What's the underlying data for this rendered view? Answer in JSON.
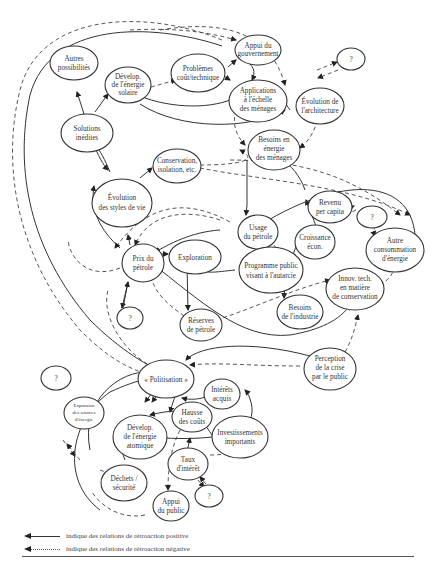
{
  "diagram": {
    "nodes": [
      {
        "id": "autres_possibilites",
        "lines": [
          "Autres",
          "possibilités"
        ]
      },
      {
        "id": "develop_solaire",
        "lines": [
          "Dévelop.",
          "de l'énergie",
          "solaire"
        ]
      },
      {
        "id": "problemes",
        "lines": [
          "Problèmes",
          "coût/technique"
        ]
      },
      {
        "id": "appui_gouvernement",
        "lines": [
          "Appui du",
          "gouvernement"
        ]
      },
      {
        "id": "q1",
        "lines": [
          "?"
        ]
      },
      {
        "id": "applications_menages",
        "lines": [
          "Applications",
          "à l'échelle",
          "des ménages"
        ]
      },
      {
        "id": "evolution_architecture",
        "lines": [
          "Évolution de",
          "l'architecture"
        ]
      },
      {
        "id": "solutions_inedites",
        "lines": [
          "Solutions",
          "inédites"
        ]
      },
      {
        "id": "besoins_menages",
        "lines": [
          "Besoins en",
          "énergie",
          "des ménages"
        ]
      },
      {
        "id": "conservation",
        "lines": [
          "Conservation,",
          "isolation, etc."
        ]
      },
      {
        "id": "evolution_styles",
        "lines": [
          "Évolution",
          "des styles de vie"
        ]
      },
      {
        "id": "revenu",
        "lines": [
          "Revenu",
          "per capita"
        ]
      },
      {
        "id": "q2",
        "lines": [
          "?"
        ]
      },
      {
        "id": "usage_petrole",
        "lines": [
          "Usage",
          "du pétrole"
        ]
      },
      {
        "id": "croissance",
        "lines": [
          "Croissance",
          "écon."
        ]
      },
      {
        "id": "autre_consommation",
        "lines": [
          "Autre",
          "consommation",
          "d'énergie"
        ]
      },
      {
        "id": "prix_petrole",
        "lines": [
          "Prix du",
          "pétrole"
        ]
      },
      {
        "id": "exploration",
        "lines": [
          "Exploration"
        ]
      },
      {
        "id": "programme_public",
        "lines": [
          "Programme public",
          "visant à l'autarcie"
        ]
      },
      {
        "id": "innov_tech",
        "lines": [
          "Innov. tech.",
          "en matière",
          "de conservation"
        ]
      },
      {
        "id": "q3",
        "lines": [
          "?"
        ]
      },
      {
        "id": "besoins_industrie",
        "lines": [
          "Besoins",
          "de l'industrie"
        ]
      },
      {
        "id": "reserves_petrole",
        "lines": [
          "Réserves",
          "de pétrole"
        ]
      },
      {
        "id": "perception_crise",
        "lines": [
          "Perception",
          "de la crise",
          "par le public"
        ]
      },
      {
        "id": "q4",
        "lines": [
          "?"
        ]
      },
      {
        "id": "politisation",
        "lines": [
          "« Politisation »"
        ]
      },
      {
        "id": "expansion_sources",
        "lines": [
          "Expansion",
          "des sources",
          "d'énergie"
        ]
      },
      {
        "id": "interets_acquis",
        "lines": [
          "Intérêts",
          "acquis"
        ]
      },
      {
        "id": "hausse_couts",
        "lines": [
          "Hausse",
          "des coûts"
        ]
      },
      {
        "id": "develop_atomique",
        "lines": [
          "Dévelop.",
          "de l'énergie",
          "atomique"
        ]
      },
      {
        "id": "investissements",
        "lines": [
          "Investissements",
          "importants"
        ]
      },
      {
        "id": "taux_interet",
        "lines": [
          "Taux",
          "d'intérêt"
        ]
      },
      {
        "id": "dechets_securite",
        "lines": [
          "Déchets /",
          "sécurité"
        ]
      },
      {
        "id": "appui_public",
        "lines": [
          "Appui",
          "du public"
        ]
      },
      {
        "id": "q5",
        "lines": [
          "?"
        ]
      }
    ]
  },
  "legend": {
    "positive": "indique des relations de rétroaction positive",
    "negative": "indique des relations de rétroaction négative"
  }
}
